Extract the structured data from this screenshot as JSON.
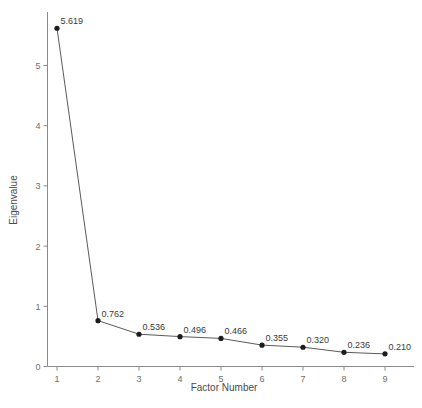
{
  "chart_data": {
    "type": "line",
    "title": "",
    "xlabel": "Factor Number",
    "ylabel": "Eigenvalue",
    "categories": [
      1,
      2,
      3,
      4,
      5,
      6,
      7,
      8,
      9
    ],
    "values": [
      5.619,
      0.762,
      0.536,
      0.496,
      0.466,
      0.355,
      0.32,
      0.236,
      0.21
    ],
    "point_labels": [
      "5.619",
      "0.762",
      "0.536",
      "0.496",
      "0.466",
      "0.355",
      "0.320",
      "0.236",
      "0.210"
    ],
    "xticks": [
      "1",
      "2",
      "3",
      "4",
      "5",
      "6",
      "7",
      "8",
      "9"
    ],
    "yticks": [
      "0",
      "1",
      "2",
      "3",
      "4",
      "5"
    ],
    "ytick_values": [
      0,
      1,
      2,
      3,
      4,
      5
    ],
    "xlim": [
      0.6,
      9.6
    ],
    "ylim": [
      0,
      6.05
    ],
    "grid": false,
    "legend": false,
    "marker": "filled-circle",
    "colors": {
      "line": "#5a5a5a",
      "marker": "#1c1c1c",
      "axis": "#8a8a8a",
      "tick_text": "#6e6e6e",
      "label_text": "#3a3a3a",
      "background": "#ffffff"
    }
  }
}
